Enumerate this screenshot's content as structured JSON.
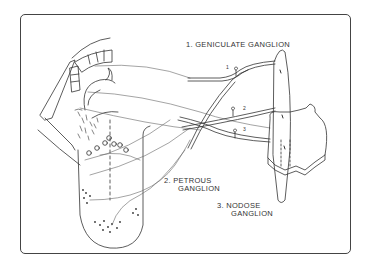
{
  "diagram": {
    "type": "anatomical-illustration",
    "labels": [
      {
        "id": "geniculate",
        "line1": "1. GENICULATE  GANGLION",
        "line2": ""
      },
      {
        "id": "petrous",
        "line1": "2. PETROUS",
        "line2": "GANGLION"
      },
      {
        "id": "nodose",
        "line1": "3. NODOSE",
        "line2": "GANGLION"
      }
    ],
    "nerve_numbers": [
      "1",
      "2",
      "3"
    ],
    "colors": {
      "line": "#333333",
      "frame": "#444444",
      "background": "#ffffff"
    }
  }
}
